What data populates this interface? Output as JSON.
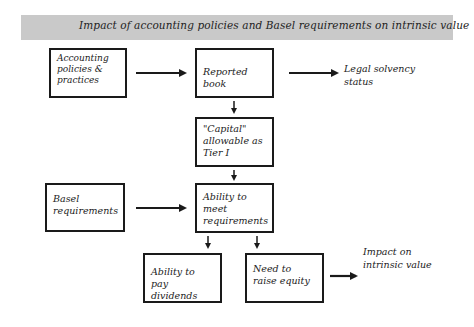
{
  "title": "Impact of accounting policies and Basel requirements on intrinsic value",
  "nodes": {
    "accounting": {
      "label": "Accounting policies & practices"
    },
    "reported_book": {
      "label": "Reported book"
    },
    "legal_solvency": {
      "label": "Legal solvency status"
    },
    "capital_tier1": {
      "label": "\"Capital\" allowable as Tier I"
    },
    "basel": {
      "label": "Basel requirements"
    },
    "ability_meet": {
      "label": "Ability to meet requirements"
    },
    "ability_dividends": {
      "label": "Ability to pay dividends"
    },
    "raise_equity": {
      "label": "Need to raise equity"
    },
    "impact_intrinsic": {
      "label": "Impact on intrinsic value"
    }
  },
  "edges": [
    {
      "from": "accounting",
      "to": "reported_book"
    },
    {
      "from": "reported_book",
      "to": "legal_solvency"
    },
    {
      "from": "reported_book",
      "to": "capital_tier1"
    },
    {
      "from": "capital_tier1",
      "to": "ability_meet"
    },
    {
      "from": "basel",
      "to": "ability_meet"
    },
    {
      "from": "ability_meet",
      "to": "ability_dividends"
    },
    {
      "from": "ability_meet",
      "to": "raise_equity"
    },
    {
      "from": "raise_equity",
      "to": "impact_intrinsic"
    }
  ],
  "colors": {
    "title_bar": "#c9c9c9",
    "stroke": "#1a1a1a"
  }
}
